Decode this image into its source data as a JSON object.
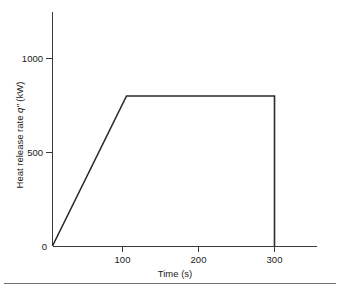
{
  "chart_data": {
    "type": "line",
    "title": "",
    "xlabel": "Time (s)",
    "ylabel_prefix": "Heat release rate ",
    "ylabel_symbol": "qʺ",
    "ylabel_suffix": " (kW)",
    "ylabel": "Heat release rate qʺ (kW)",
    "x": [
      0,
      100,
      300,
      300
    ],
    "y": [
      0,
      800,
      800,
      0
    ],
    "series": [
      {
        "name": "Heat release rate",
        "points": [
          {
            "x": 0,
            "y": 0
          },
          {
            "x": 100,
            "y": 800
          },
          {
            "x": 300,
            "y": 800
          },
          {
            "x": 300,
            "y": 0
          }
        ]
      }
    ],
    "xlim": [
      0,
      350
    ],
    "ylim": [
      0,
      1250
    ],
    "xticks": [
      100,
      200,
      300
    ],
    "xtick_labels": [
      "100",
      "200",
      "300"
    ],
    "yticks": [
      0,
      500,
      1000
    ],
    "ytick_labels": [
      "0",
      "500",
      "1000"
    ],
    "plateau_value": 800,
    "grid": false,
    "legend": false,
    "line_color": "#2b2b2b",
    "axis_color": "#3a3a3a",
    "background_color": "#ffffff"
  }
}
